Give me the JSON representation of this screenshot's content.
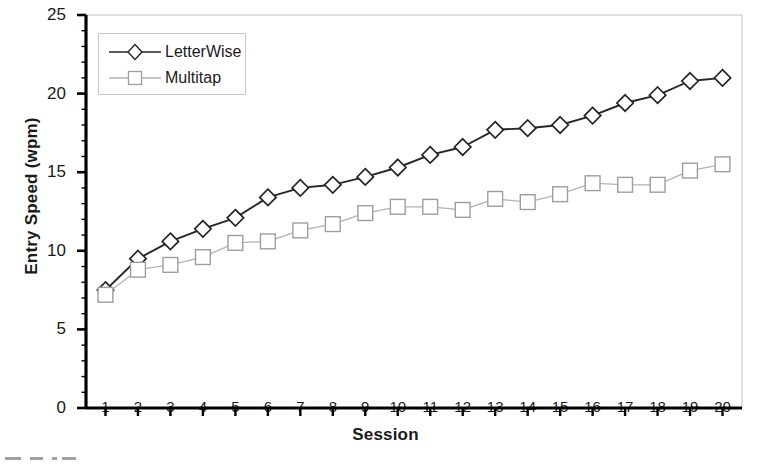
{
  "figure": {
    "background_color": "#ffffff",
    "series_colors": {
      "letterwise": "#262626",
      "multitap": "#b3b3b3"
    },
    "axis_color": "#000000",
    "frame_color": "#c0c0c0"
  },
  "axes": {
    "ylabel": "Entry Speed (wpm)",
    "xlabel": "Session",
    "yticks": [
      "0",
      "5",
      "10",
      "15",
      "20",
      "25"
    ],
    "xticks": [
      "1",
      "2",
      "3",
      "4",
      "5",
      "6",
      "7",
      "8",
      "9",
      "10",
      "11",
      "12",
      "13",
      "14",
      "15",
      "16",
      "17",
      "18",
      "19",
      "20"
    ]
  },
  "legend": {
    "position": "upper-left-inside",
    "entries": [
      {
        "label": "LetterWise",
        "marker": "diamond-open",
        "color": "#262626"
      },
      {
        "label": "Multitap",
        "marker": "square-open",
        "color": "#b3b3b3"
      }
    ]
  },
  "caption_fragment": "",
  "chart_data": {
    "type": "line",
    "title": "",
    "xlabel": "Session",
    "ylabel": "Entry Speed (wpm)",
    "xlim": [
      0.4,
      20.6
    ],
    "ylim": [
      0,
      25
    ],
    "ytick_step": 5,
    "yminor_step": 1,
    "grid": false,
    "legend_position": "upper left",
    "x": [
      1,
      2,
      3,
      4,
      5,
      6,
      7,
      8,
      9,
      10,
      11,
      12,
      13,
      14,
      15,
      16,
      17,
      18,
      19,
      20
    ],
    "categories": [
      "1",
      "2",
      "3",
      "4",
      "5",
      "6",
      "7",
      "8",
      "9",
      "10",
      "11",
      "12",
      "13",
      "14",
      "15",
      "16",
      "17",
      "18",
      "19",
      "20"
    ],
    "series": [
      {
        "name": "LetterWise",
        "marker": "diamond-open",
        "color": "#262626",
        "values": [
          7.5,
          9.5,
          10.6,
          11.4,
          12.1,
          13.4,
          14.0,
          14.2,
          14.7,
          15.3,
          16.1,
          16.6,
          17.7,
          17.8,
          18.0,
          18.6,
          19.4,
          19.9,
          20.8,
          21.0
        ]
      },
      {
        "name": "Multitap",
        "marker": "square-open",
        "color": "#b3b3b3",
        "values": [
          7.2,
          8.8,
          9.1,
          9.6,
          10.5,
          10.6,
          11.3,
          11.7,
          12.4,
          12.8,
          12.8,
          12.6,
          13.3,
          13.1,
          13.6,
          14.3,
          14.2,
          14.2,
          15.1,
          15.5
        ]
      }
    ]
  }
}
